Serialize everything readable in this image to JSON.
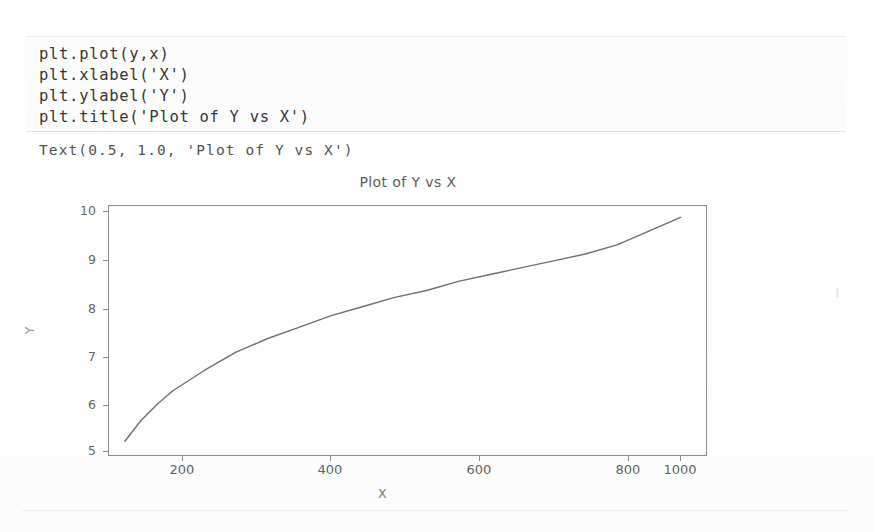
{
  "code_cell": {
    "lines": [
      "plt.plot(y,x)",
      "plt.xlabel('X')",
      "plt.ylabel('Y')",
      "plt.title('Plot of Y vs X')"
    ]
  },
  "output": {
    "text": "Text(0.5, 1.0, 'Plot of Y vs X')"
  },
  "figure": {
    "title": "Plot of Y vs X",
    "xlabel": "X",
    "ylabel": "Y"
  },
  "chart_data": {
    "type": "line",
    "title": "Plot of Y vs X",
    "xlabel": "X",
    "ylabel": "Y",
    "xlim": [
      100,
      1040
    ],
    "ylim": [
      4.7,
      10.15
    ],
    "xticks": [
      200,
      400,
      600,
      800,
      1000
    ],
    "yticks": [
      5,
      6,
      7,
      8,
      9,
      10
    ],
    "grid": false,
    "legend": null,
    "series": [
      {
        "name": "Y vs X",
        "color": "#707070",
        "x": [
          125,
          150,
          175,
          200,
          250,
          300,
          350,
          400,
          450,
          500,
          550,
          600,
          650,
          700,
          750,
          800,
          850,
          900,
          950,
          1000
        ],
        "y": [
          5.0,
          5.45,
          5.8,
          6.1,
          6.55,
          6.95,
          7.25,
          7.5,
          7.75,
          7.95,
          8.15,
          8.3,
          8.5,
          8.65,
          8.8,
          8.95,
          9.1,
          9.3,
          9.6,
          9.9
        ]
      }
    ]
  },
  "axis": {
    "yticks": [
      {
        "label": "10",
        "top": 6
      },
      {
        "label": "9",
        "top": 55
      },
      {
        "label": "8",
        "top": 104
      },
      {
        "label": "7",
        "top": 152
      },
      {
        "label": "6",
        "top": 200
      },
      {
        "label": "5",
        "top": 246
      }
    ],
    "xticks": [
      {
        "label": "200",
        "left": 74
      },
      {
        "label": "400",
        "left": 222
      },
      {
        "label": "600",
        "left": 371
      },
      {
        "label": "800",
        "left": 520
      },
      {
        "label": "1000",
        "left": 572
      }
    ]
  }
}
